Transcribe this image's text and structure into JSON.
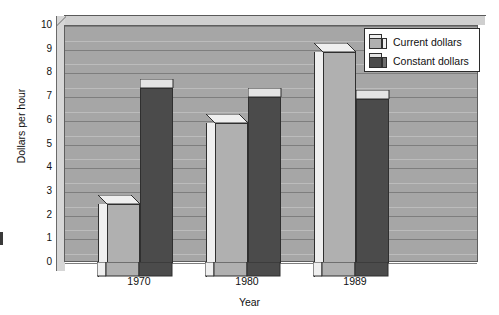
{
  "chart_data": {
    "type": "bar",
    "title": "",
    "xlabel": "Year",
    "ylabel": "Dollars per hour",
    "categories": [
      "1970",
      "1980",
      "1989"
    ],
    "series": [
      {
        "name": "Current dollars",
        "values": [
          2.5,
          5.9,
          8.9
        ],
        "color": "#b0b0b0"
      },
      {
        "name": "Constant dollars",
        "values": [
          7.4,
          7.0,
          6.9
        ],
        "color": "#4b4b4b"
      }
    ],
    "ylim": [
      0,
      10
    ],
    "yticks": [
      "0",
      "1",
      "2",
      "3",
      "4",
      "5",
      "6",
      "7",
      "8",
      "9",
      "10"
    ],
    "grid": true,
    "legend_position": "top-right",
    "style": "3d-bar",
    "plot_background": "#a6a6a6"
  },
  "axes": {
    "y_title": "Dollars per hour",
    "x_title": "Year",
    "y_ticks": [
      "10",
      "9",
      "8",
      "7",
      "6",
      "5",
      "4",
      "3",
      "2",
      "1",
      "0"
    ],
    "x_ticks": [
      "1970",
      "1980",
      "1989"
    ]
  },
  "legend": {
    "items": [
      {
        "label": "Current dollars",
        "swatch": "light-cube-icon"
      },
      {
        "label": "Constant dollars",
        "swatch": "dark-cube-icon"
      }
    ]
  },
  "colors": {
    "plot_bg": "#a6a6a6",
    "grid": "#7e7e7e",
    "light_bar_front": "#b0b0b0",
    "light_bar_top": "#efefef",
    "light_bar_side": "#efefef",
    "dark_bar_front": "#4b4b4b",
    "dark_bar_top": "#e4e4e4",
    "dark_bar_side": "#6e6e6e",
    "frame": "#5e5e5e",
    "page_bg": "#ffffff"
  }
}
